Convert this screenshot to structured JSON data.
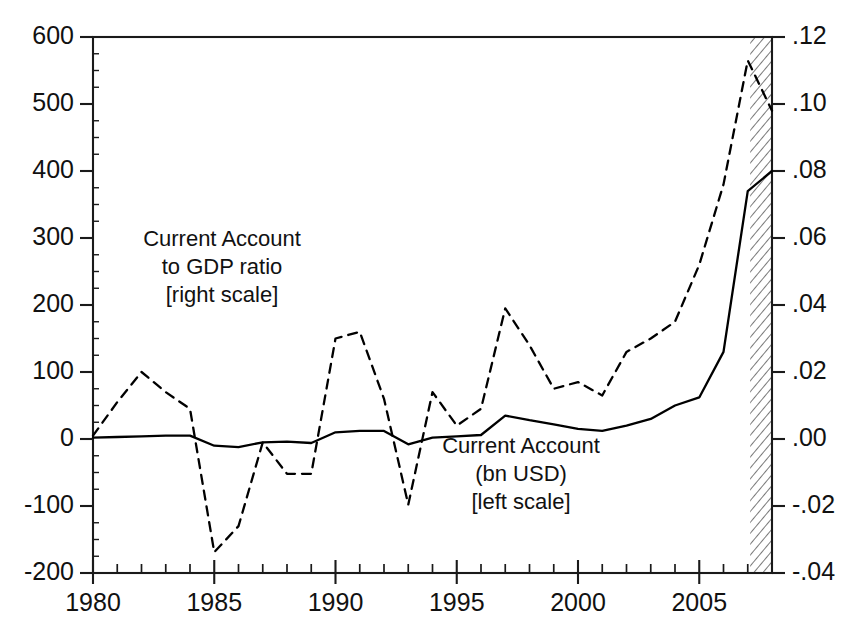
{
  "chart_data": {
    "type": "line",
    "title": "",
    "subtitle": "",
    "xlabel": "",
    "ylabel": "",
    "grid": false,
    "legend_position": "inline-annotation",
    "x": [
      1980,
      1981,
      1982,
      1983,
      1984,
      1985,
      1986,
      1987,
      1988,
      1989,
      1990,
      1991,
      1992,
      1993,
      1994,
      1995,
      1996,
      1997,
      1998,
      1999,
      2000,
      2001,
      2002,
      2003,
      2004,
      2005,
      2006,
      2007,
      2008
    ],
    "xlim": [
      1980,
      2008
    ],
    "xticks_major": [
      "1980",
      "1985",
      "1990",
      "1995",
      "2000",
      "2005"
    ],
    "xticks_major_values": [
      1980,
      1985,
      1990,
      1995,
      2000,
      2005
    ],
    "xtick_minor_step": 1,
    "left_axis": {
      "label": "Current Account (bn USD)",
      "ylim": [
        -200,
        600
      ],
      "ytick_step": 100,
      "yticks": [
        "600",
        "500",
        "400",
        "300",
        "200",
        "100",
        "0",
        "-100",
        "-200"
      ],
      "ytick_values": [
        600,
        500,
        400,
        300,
        200,
        100,
        0,
        -100,
        -200
      ]
    },
    "right_axis": {
      "label": "Current Account to GDP ratio",
      "ylim": [
        -0.04,
        0.12
      ],
      "ytick_step": 0.02,
      "yticks": [
        ".12",
        ".10",
        ".08",
        ".06",
        ".04",
        ".02",
        ".00",
        "-.02",
        "-.04"
      ],
      "ytick_values": [
        0.12,
        0.1,
        0.08,
        0.06,
        0.04,
        0.02,
        0.0,
        -0.02,
        -0.04
      ]
    },
    "series": [
      {
        "name": "Current Account (bn USD)",
        "axis": "left",
        "style": "solid",
        "color": "#000000",
        "values": [
          2,
          3,
          4,
          5,
          5,
          -10,
          -12,
          -5,
          -4,
          -6,
          10,
          12,
          12,
          -8,
          2,
          4,
          6,
          35,
          28,
          22,
          15,
          12,
          20,
          30,
          50,
          62,
          130,
          370,
          400
        ]
      },
      {
        "name": "Current Account to GDP ratio",
        "axis": "right",
        "style": "dashed",
        "color": "#000000",
        "values_bn_equivalent": [
          5,
          55,
          100,
          70,
          45,
          -188,
          -130,
          -5,
          -52,
          -52,
          150,
          160,
          60,
          -98,
          70,
          20,
          45,
          195,
          140,
          75,
          85,
          65,
          130,
          150,
          175,
          260,
          380,
          565,
          490
        ],
        "values": [
          0.001,
          0.011,
          0.02,
          0.014,
          0.009,
          -0.0338,
          -0.026,
          -0.001,
          -0.0104,
          -0.0104,
          0.03,
          0.032,
          0.012,
          -0.0196,
          0.014,
          0.004,
          0.009,
          0.039,
          0.028,
          0.015,
          0.017,
          0.013,
          0.026,
          0.03,
          0.035,
          0.052,
          0.076,
          0.113,
          0.098
        ]
      }
    ],
    "annotations": [
      {
        "name": "gdp-ratio-annotation",
        "lines": [
          "Current Account",
          "to GDP ratio",
          "[right scale]"
        ],
        "x_px": 222,
        "y_px": 240
      },
      {
        "name": "current-account-annotation",
        "lines": [
          "Current Account",
          "(bn USD)",
          "[left scale]"
        ],
        "x_px": 521,
        "y_px": 447
      }
    ],
    "shaded_region": {
      "name": "forecast-region",
      "label": "",
      "pattern": "diagonal-hatch",
      "x_start": 2007.1,
      "x_end": 2008
    }
  }
}
